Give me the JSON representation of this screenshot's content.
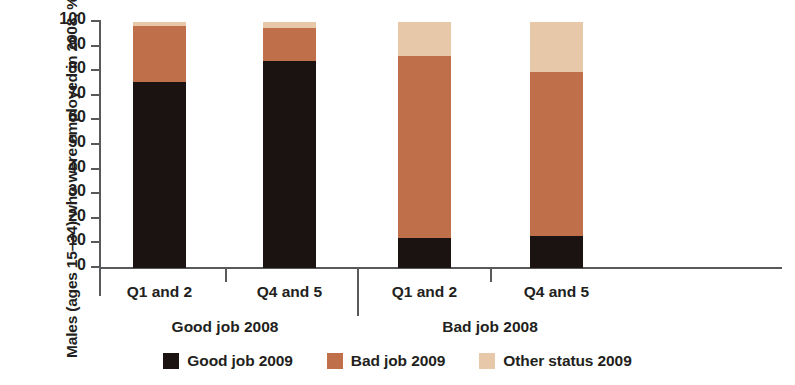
{
  "chart_data": {
    "type": "bar",
    "stacked": true,
    "title": "",
    "xlabel": "",
    "ylabel": "Males (ages 15–34) who were employed in 2008, %",
    "ylim": [
      0,
      100
    ],
    "ytick_step": 10,
    "yticks": [
      "100",
      "90",
      "80",
      "70",
      "60",
      "50",
      "40",
      "30",
      "20",
      "10",
      "0"
    ],
    "grid": false,
    "legend_position": "bottom-center",
    "groups": [
      {
        "label": "Good job  2008",
        "categories": [
          "Q1 and 2",
          "Q4 and 5"
        ]
      },
      {
        "label": "Bad job 2008",
        "categories": [
          "Q1 and 2",
          "Q4 and 5"
        ]
      }
    ],
    "categories": [
      "Q1 and 2",
      "Q4 and 5",
      "Q1 and 2",
      "Q4 and 5"
    ],
    "series": [
      {
        "name": "Good job 2009",
        "color": "#1a1311",
        "values": [
          75.5,
          84,
          12,
          13
        ]
      },
      {
        "name": "Bad job 2009",
        "color": "#c06f4b",
        "values": [
          23,
          13.5,
          74,
          66.5
        ]
      },
      {
        "name": "Other status 2009",
        "color": "#e7c8a8",
        "values": [
          1.5,
          2.5,
          14,
          20.5
        ]
      }
    ],
    "legend": [
      {
        "label": "Good job 2009",
        "color": "#1a1311"
      },
      {
        "label": "Bad job 2009",
        "color": "#c06f4b"
      },
      {
        "label": "Other status 2009",
        "color": "#e7c8a8"
      }
    ]
  },
  "colors": {
    "good_job": "#1a1311",
    "bad_job": "#c06f4b",
    "other_status": "#e7c8a8",
    "axis": "#58595b",
    "text": "#231f20",
    "background": "#ffffff"
  }
}
